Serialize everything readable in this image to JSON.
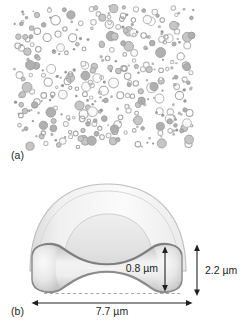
{
  "figure": {
    "background_color": "#ffffff"
  },
  "panel_a": {
    "label": "(a)",
    "description": "blood-smear-scatter-field",
    "field": {
      "x": 13,
      "y": 4,
      "width": 183,
      "height": 147
    },
    "circle_color_outline": "#a8a8a8",
    "circle_color_fill": "#b8b8b8",
    "circle_count": 352,
    "circle_size_range": [
      2,
      11
    ]
  },
  "panel_b": {
    "label": "(b)",
    "description": "red-blood-cell-cross-section-schematic",
    "colors": {
      "outer_dome_fill": "#f0f0f0",
      "outer_dome_stroke": "#b4b4b4",
      "inner_dome_fill": "#e6e6e6",
      "inner_dome_stroke": "#c4c4c4",
      "disc_fill": "#e2e2e2",
      "disc_stroke": "#8c8c8c",
      "dimension_line": "#231f20",
      "dashed_line": "#a0a0a0"
    },
    "dimensions": [
      {
        "id": "thickness-rim",
        "label": "0.8 µm",
        "orientation": "vertical",
        "value": 0.8,
        "unit": "µm"
      },
      {
        "id": "height-total",
        "label": "2.2 µm",
        "orientation": "vertical",
        "value": 2.2,
        "unit": "µm"
      },
      {
        "id": "diameter",
        "label": "7.7 µm",
        "orientation": "horizontal",
        "value": 7.7,
        "unit": "µm"
      }
    ]
  }
}
